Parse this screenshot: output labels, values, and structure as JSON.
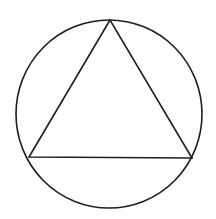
{
  "diagram": {
    "background": "#ffffff",
    "stroke_color": "#1e1e1e",
    "stroke_width": 1.6,
    "circle": {
      "cx": 109,
      "cy": 114,
      "rx": 93,
      "ry": 94
    },
    "triangle": {
      "vertices": [
        {
          "name": "top",
          "x": 110,
          "y": 20
        },
        {
          "name": "bottom-left",
          "x": 29,
          "y": 157
        },
        {
          "name": "bottom-right",
          "x": 192,
          "y": 158
        }
      ]
    }
  }
}
